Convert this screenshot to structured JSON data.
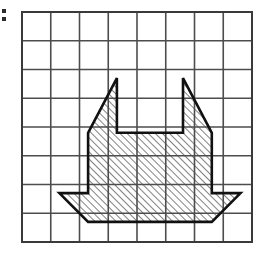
{
  "figure": {
    "grid": {
      "columns": 8,
      "rows": 8,
      "origin_x": 22,
      "origin_y": 12,
      "cell_size": 28.75,
      "line_color": "#4d4d4d",
      "line_width": 1.6,
      "border_color": "#3a3a3a",
      "border_width": 2.0,
      "background": "#ffffff"
    },
    "shape": {
      "name": "hatched-polygon",
      "fill_pattern": "diagonal-hatch-45",
      "hatch_color": "#1a1a1a",
      "hatch_spacing": 5,
      "hatch_width": 1.1,
      "outline_color": "#111111",
      "outline_width": 2.6,
      "fill_background": "#ffffff",
      "vertices_grid": [
        [
          3.3,
          2.3
        ],
        [
          3.3,
          4.2
        ],
        [
          5.6,
          4.2
        ],
        [
          5.6,
          2.3
        ],
        [
          6.6,
          4.2
        ],
        [
          6.6,
          6.3
        ],
        [
          7.6,
          6.3
        ],
        [
          6.6,
          7.3
        ],
        [
          2.3,
          7.3
        ],
        [
          1.3,
          6.3
        ],
        [
          2.3,
          6.3
        ],
        [
          2.3,
          4.2
        ]
      ],
      "vertices_pixels": [
        [
          116.9,
          78.1
        ],
        [
          116.9,
          132.8
        ],
        [
          183.0,
          132.8
        ],
        [
          183.0,
          78.1
        ],
        [
          211.8,
          132.8
        ],
        [
          211.8,
          193.1
        ],
        [
          240.5,
          193.1
        ],
        [
          211.8,
          221.9
        ],
        [
          88.1,
          221.9
        ],
        [
          59.4,
          193.1
        ],
        [
          88.1,
          193.1
        ],
        [
          88.1,
          132.8
        ]
      ],
      "features": [
        "left-horn-triangle",
        "center-notch",
        "right-horn-triangle",
        "left-bottom-tail",
        "right-bottom-tail",
        "rectangular-body"
      ]
    },
    "edge_marks": {
      "count": 2,
      "color": "#2b2b2b",
      "note": "two small clipped marks at the left image edge"
    }
  }
}
